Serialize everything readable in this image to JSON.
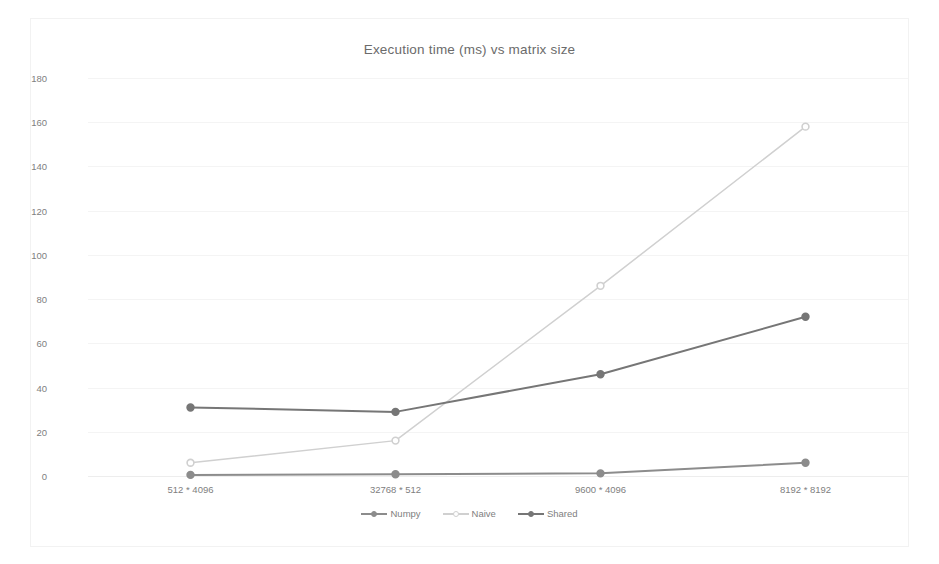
{
  "chart_data": {
    "type": "line",
    "title": "Execution time (ms) vs matrix size",
    "xlabel": "",
    "ylabel": "",
    "categories": [
      "512 * 4096",
      "32768 * 512",
      "9600 * 4096",
      "8192 * 8192"
    ],
    "series": [
      {
        "name": "Numpy",
        "values": [
          0.5,
          0.8,
          1.2,
          6
        ],
        "color": "#8c8c8c"
      },
      {
        "name": "Naive",
        "values": [
          6,
          16,
          86,
          158
        ],
        "color": "#d0d0d0"
      },
      {
        "name": "Shared",
        "values": [
          31,
          29,
          46,
          72
        ],
        "color": "#767676"
      }
    ],
    "ylim": [
      0,
      180
    ],
    "yticks": [
      0,
      20,
      40,
      60,
      80,
      100,
      120,
      140,
      160,
      180
    ],
    "grid": true,
    "legend_position": "bottom",
    "markers": "circle"
  },
  "legend": {
    "items": [
      {
        "label": "Numpy"
      },
      {
        "label": "Naive"
      },
      {
        "label": "Shared"
      }
    ]
  },
  "colors": {
    "background": "#ffffff",
    "gridline": "#f4f4f4",
    "title_text": "#6b6b6b",
    "tick_text": "#808080",
    "numpy": "#8c8c8c",
    "naive": "#d0d0d0",
    "shared": "#767676"
  }
}
